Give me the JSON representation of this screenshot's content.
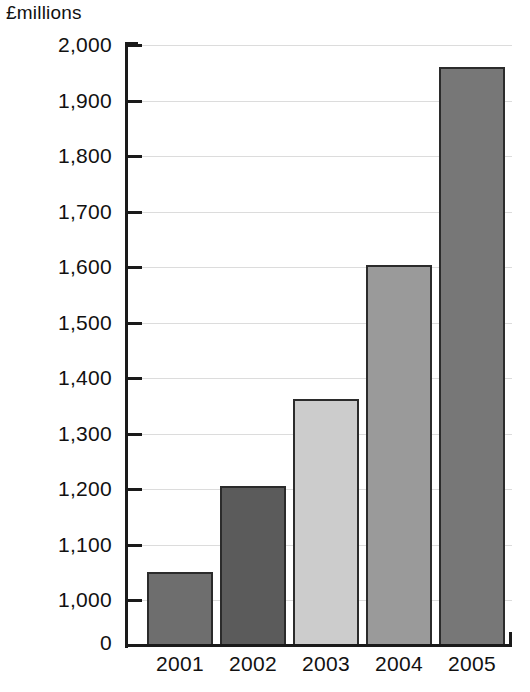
{
  "chart_data": {
    "type": "bar",
    "title": "",
    "subtitle": "",
    "xlabel": "",
    "ylabel": "£millions",
    "unit_label": "£millions",
    "categories": [
      "2001",
      "2002",
      "2003",
      "2004",
      "2005"
    ],
    "values": [
      1050,
      1205,
      1363,
      1604,
      1960
    ],
    "series": [
      {
        "name": "",
        "values": [
          1050,
          1205,
          1363,
          1604,
          1960
        ]
      }
    ],
    "bar_colors": [
      "#6e6e6e",
      "#5b5b5b",
      "#cccccc",
      "#9a9a9a",
      "#777777"
    ],
    "bar_border_color": "#2b2b2b",
    "ylim": [
      1000,
      2000
    ],
    "y_axis_has_break": true,
    "y_baseline_tick": "0",
    "ytick_labels": [
      "0",
      "1,000",
      "1,100",
      "1,200",
      "1,300",
      "1,400",
      "1,500",
      "1,600",
      "1,700",
      "1,800",
      "1,900",
      "2,000"
    ],
    "ytick_values": [
      0,
      1000,
      1100,
      1200,
      1300,
      1400,
      1500,
      1600,
      1700,
      1800,
      1900,
      2000
    ],
    "grid": true,
    "grid_color": "#dcdcdc",
    "legend": "none",
    "legend_position": "none",
    "annotations": []
  },
  "axis": {
    "unit_label": "£millions",
    "y_ticks": [
      {
        "label": "2,000",
        "value": 2000
      },
      {
        "label": "1,900",
        "value": 1900
      },
      {
        "label": "1,800",
        "value": 1800
      },
      {
        "label": "1,700",
        "value": 1700
      },
      {
        "label": "1,600",
        "value": 1600
      },
      {
        "label": "1,500",
        "value": 1500
      },
      {
        "label": "1,400",
        "value": 1400
      },
      {
        "label": "1,300",
        "value": 1300
      },
      {
        "label": "1,200",
        "value": 1200
      },
      {
        "label": "1,100",
        "value": 1100
      },
      {
        "label": "1,000",
        "value": 1000
      },
      {
        "label": "0",
        "value": 0
      }
    ],
    "x_ticks": [
      {
        "label": "2001"
      },
      {
        "label": "2002"
      },
      {
        "label": "2003"
      },
      {
        "label": "2004"
      },
      {
        "label": "2005"
      }
    ]
  },
  "bars": [
    {
      "category": "2001",
      "value": 1050,
      "color": "#6e6e6e"
    },
    {
      "category": "2002",
      "value": 1205,
      "color": "#5b5b5b"
    },
    {
      "category": "2003",
      "value": 1363,
      "color": "#cccccc"
    },
    {
      "category": "2004",
      "value": 1604,
      "color": "#9a9a9a"
    },
    {
      "category": "2005",
      "value": 1960,
      "color": "#777777"
    }
  ]
}
